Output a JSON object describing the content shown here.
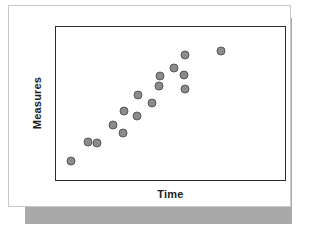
{
  "figure": {
    "background_color": "#ffffff",
    "card_color": "#ffffff",
    "card_border_color": "#c9c9c9",
    "shadow_color": "#a9a9a9",
    "frame_color": "#2b2b2b"
  },
  "chart_data": {
    "type": "scatter",
    "title": "",
    "subtitle": "",
    "xlabel": "Time",
    "ylabel": "Measures",
    "grid": false,
    "legend": null,
    "legend_position": "none",
    "xlim": [
      0,
      100
    ],
    "ylim": [
      0,
      100
    ],
    "xticks": [],
    "yticks": [],
    "xtick_labels": [],
    "ytick_labels": [],
    "annotations": [],
    "marker": {
      "shape": "circle",
      "fill_color": "#8b8b8b",
      "edge_color": "#585858",
      "size_px": 9
    },
    "series": [
      {
        "name": "Measures over Time",
        "points": [
          {
            "x": 6.5,
            "y": 12.5
          },
          {
            "x": 13.9,
            "y": 25.0
          },
          {
            "x": 17.7,
            "y": 24.2
          },
          {
            "x": 25.1,
            "y": 36.0
          },
          {
            "x": 29.4,
            "y": 31.0
          },
          {
            "x": 29.9,
            "y": 45.0
          },
          {
            "x": 35.5,
            "y": 42.0
          },
          {
            "x": 35.9,
            "y": 55.5
          },
          {
            "x": 42.0,
            "y": 50.2
          },
          {
            "x": 45.0,
            "y": 61.7
          },
          {
            "x": 45.5,
            "y": 68.0
          },
          {
            "x": 51.5,
            "y": 73.0
          },
          {
            "x": 55.9,
            "y": 68.5
          },
          {
            "x": 56.3,
            "y": 81.5
          },
          {
            "x": 56.5,
            "y": 59.5
          },
          {
            "x": 72.0,
            "y": 84.5
          }
        ]
      }
    ]
  }
}
